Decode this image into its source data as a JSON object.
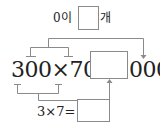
{
  "top": {
    "prefix": "0이",
    "suffix": "개",
    "answer_box_value": ""
  },
  "main": {
    "expression": "300×70=",
    "answer_box_value": "",
    "suffix": "000"
  },
  "bottom": {
    "expression": "3×7=",
    "answer_box_value": ""
  },
  "colors": {
    "line": "#8a8a8a",
    "text": "#222222"
  }
}
